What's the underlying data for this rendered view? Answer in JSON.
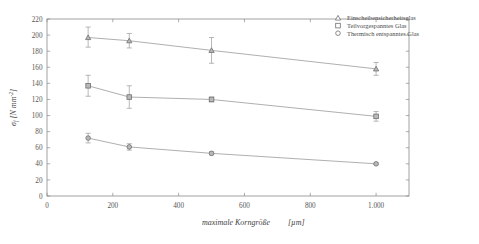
{
  "chart_data": {
    "type": "line",
    "title": "",
    "subtitle": "",
    "xlabel": "maximale Korngröße",
    "xlabel_unit": "[µm]",
    "ylabel": "σf",
    "ylabel_unit": "[N mm-2]",
    "ylabel_full": "σf  [N mm-2]",
    "x": [
      125,
      250,
      500,
      1000
    ],
    "xlim": [
      0,
      1100
    ],
    "ylim": [
      0,
      220
    ],
    "xticks": [
      0,
      200,
      400,
      600,
      800,
      1000
    ],
    "xticklabels": [
      "0",
      "200",
      "400",
      "600",
      "800",
      "1.000"
    ],
    "yticks": [
      0,
      20,
      40,
      60,
      80,
      100,
      120,
      140,
      160,
      180,
      200,
      220
    ],
    "yticklabels": [
      "0",
      "20",
      "40",
      "60",
      "80",
      "100",
      "120",
      "140",
      "160",
      "180",
      "200",
      "220"
    ],
    "grid": false,
    "legend_position": "top-right",
    "error_bars": true,
    "series": [
      {
        "name": "Einscheibensicherheitsglas",
        "marker": "triangle",
        "values": [
          197,
          193,
          181,
          158
        ],
        "err_low": [
          12,
          9,
          16,
          8
        ],
        "err_high": [
          13,
          9,
          16,
          8
        ]
      },
      {
        "name": "Teilvorgespanntes Glas",
        "marker": "square",
        "values": [
          137,
          123,
          120,
          99
        ],
        "err_low": [
          13,
          14,
          3,
          6
        ],
        "err_high": [
          13,
          14,
          3,
          6
        ]
      },
      {
        "name": "Thermisch entspanntes Glas",
        "marker": "circle",
        "values": [
          72,
          61,
          53,
          40
        ],
        "err_low": [
          6,
          4,
          2,
          1
        ],
        "err_high": [
          6,
          4,
          2,
          1
        ]
      }
    ]
  },
  "legend": {
    "entries": [
      {
        "label": "Einscheibensicherheitsglas",
        "marker": "triangle"
      },
      {
        "label": "Teilvorgespanntes Glas",
        "marker": "square"
      },
      {
        "label": "Thermisch entspanntes Glas",
        "marker": "circle"
      }
    ]
  },
  "colors": {
    "axis": "#8a8a8a",
    "line": "#9a9a9a",
    "marker_edge": "#6f6f6f",
    "marker_fill": "#ffffff",
    "text": "#4a4a4a",
    "background": "#ffffff"
  }
}
